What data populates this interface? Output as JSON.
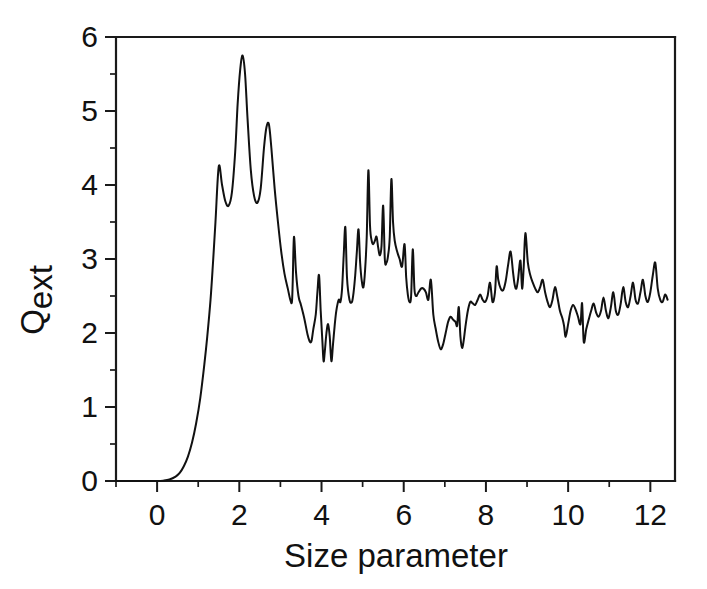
{
  "figure": {
    "background_color": "#ffffff",
    "line_color": "#111111",
    "axis_color": "#1a1a1a"
  },
  "chart_data": {
    "type": "line",
    "title": "",
    "xlabel": "Size parameter",
    "ylabel": "Qext",
    "ylabel_base": "Q",
    "ylabel_subscript": "ext",
    "xlim": [
      -1.0,
      12.6
    ],
    "ylim": [
      0,
      6
    ],
    "xticks": [
      0,
      2,
      4,
      6,
      8,
      10,
      12
    ],
    "xticklabels": [
      "0",
      "2",
      "4",
      "6",
      "8",
      "10",
      "12"
    ],
    "xminorticks": [
      -1,
      1,
      3,
      5,
      7,
      9,
      11
    ],
    "yticks": [
      0,
      1,
      2,
      3,
      4,
      5,
      6
    ],
    "yticklabels": [
      "0",
      "1",
      "2",
      "3",
      "4",
      "5",
      "6"
    ],
    "yminorticks": [
      0.5,
      1.5,
      2.5,
      3.5,
      4.5,
      5.5
    ],
    "grid": false,
    "legend": null,
    "series": [
      {
        "name": "Extinction efficiency",
        "x": [
          -1.0,
          -0.6,
          -0.3,
          0.0,
          0.15,
          0.3,
          0.45,
          0.55,
          0.65,
          0.75,
          0.85,
          0.95,
          1.05,
          1.15,
          1.22,
          1.3,
          1.36,
          1.42,
          1.5,
          1.58,
          1.66,
          1.74,
          1.82,
          1.9,
          1.96,
          2.02,
          2.08,
          2.14,
          2.2,
          2.28,
          2.36,
          2.44,
          2.52,
          2.6,
          2.66,
          2.72,
          2.78,
          2.86,
          2.94,
          3.02,
          3.1,
          3.18,
          3.24,
          3.28,
          3.3,
          3.33,
          3.38,
          3.44,
          3.5,
          3.58,
          3.66,
          3.72,
          3.76,
          3.8,
          3.86,
          3.9,
          3.94,
          3.98,
          4.02,
          4.05,
          4.08,
          4.12,
          4.16,
          4.2,
          4.24,
          4.28,
          4.32,
          4.36,
          4.42,
          4.46,
          4.5,
          4.54,
          4.58,
          4.62,
          4.68,
          4.74,
          4.78,
          4.82,
          4.86,
          4.9,
          4.94,
          4.98,
          5.02,
          5.06,
          5.1,
          5.14,
          5.18,
          5.22,
          5.26,
          5.3,
          5.34,
          5.38,
          5.42,
          5.46,
          5.5,
          5.54,
          5.58,
          5.62,
          5.66,
          5.7,
          5.74,
          5.78,
          5.84,
          5.9,
          5.96,
          6.02,
          6.06,
          6.1,
          6.14,
          6.18,
          6.22,
          6.26,
          6.3,
          6.36,
          6.42,
          6.48,
          6.54,
          6.6,
          6.66,
          6.72,
          6.78,
          6.84,
          6.9,
          6.96,
          7.02,
          7.08,
          7.14,
          7.2,
          7.26,
          7.3,
          7.34,
          7.38,
          7.42,
          7.46,
          7.5,
          7.56,
          7.62,
          7.68,
          7.74,
          7.8,
          7.86,
          7.92,
          7.98,
          8.04,
          8.1,
          8.16,
          8.22,
          8.26,
          8.3,
          8.36,
          8.42,
          8.48,
          8.54,
          8.6,
          8.66,
          8.7,
          8.74,
          8.78,
          8.84,
          8.88,
          8.92,
          8.96,
          9.02,
          9.08,
          9.14,
          9.2,
          9.26,
          9.32,
          9.38,
          9.44,
          9.5,
          9.56,
          9.62,
          9.68,
          9.74,
          9.8,
          9.86,
          9.9,
          9.94,
          10.0,
          10.06,
          10.12,
          10.18,
          10.24,
          10.3,
          10.34,
          10.38,
          10.44,
          10.5,
          10.56,
          10.62,
          10.68,
          10.74,
          10.8,
          10.86,
          10.92,
          10.98,
          11.04,
          11.1,
          11.16,
          11.22,
          11.28,
          11.34,
          11.4,
          11.46,
          11.52,
          11.58,
          11.64,
          11.7,
          11.76,
          11.82,
          11.88,
          11.94,
          12.0,
          12.06,
          12.12,
          12.18,
          12.24,
          12.3,
          12.36,
          12.42
        ],
        "y": [
          0.0,
          0.0,
          0.0,
          0.0,
          0.005,
          0.02,
          0.06,
          0.11,
          0.2,
          0.33,
          0.52,
          0.78,
          1.12,
          1.58,
          1.95,
          2.45,
          2.95,
          3.5,
          4.25,
          4.0,
          3.78,
          3.72,
          3.9,
          4.45,
          5.1,
          5.55,
          5.75,
          5.5,
          4.9,
          4.2,
          3.85,
          3.76,
          3.95,
          4.5,
          4.78,
          4.82,
          4.5,
          3.95,
          3.5,
          3.1,
          2.8,
          2.6,
          2.45,
          2.42,
          2.7,
          3.3,
          2.82,
          2.5,
          2.38,
          2.2,
          1.98,
          1.88,
          1.9,
          2.05,
          2.25,
          2.55,
          2.78,
          2.3,
          1.9,
          1.62,
          1.75,
          2.0,
          2.12,
          1.95,
          1.62,
          1.85,
          2.1,
          2.3,
          2.45,
          2.42,
          2.6,
          3.05,
          3.43,
          2.75,
          2.45,
          2.42,
          2.55,
          2.78,
          3.1,
          3.4,
          2.95,
          2.7,
          2.62,
          2.85,
          3.3,
          4.2,
          3.45,
          3.25,
          3.2,
          3.25,
          3.3,
          3.15,
          3.05,
          3.18,
          3.72,
          3.0,
          2.95,
          3.05,
          3.3,
          4.08,
          3.5,
          3.25,
          3.1,
          3.0,
          2.9,
          3.2,
          2.75,
          2.52,
          2.42,
          2.5,
          3.13,
          2.6,
          2.5,
          2.55,
          2.6,
          2.6,
          2.55,
          2.45,
          2.72,
          2.25,
          2.05,
          1.88,
          1.78,
          1.85,
          2.0,
          2.15,
          2.22,
          2.18,
          2.15,
          2.1,
          2.35,
          1.95,
          1.8,
          1.9,
          2.08,
          2.3,
          2.42,
          2.4,
          2.38,
          2.45,
          2.52,
          2.45,
          2.42,
          2.5,
          2.68,
          2.42,
          2.55,
          2.9,
          2.72,
          2.6,
          2.58,
          2.7,
          2.92,
          3.1,
          2.82,
          2.65,
          2.6,
          2.72,
          2.98,
          2.6,
          2.9,
          3.35,
          2.95,
          2.78,
          2.68,
          2.6,
          2.55,
          2.62,
          2.72,
          2.55,
          2.42,
          2.35,
          2.45,
          2.62,
          2.48,
          2.3,
          2.2,
          2.1,
          1.95,
          2.12,
          2.3,
          2.38,
          2.32,
          2.22,
          2.12,
          2.4,
          1.88,
          2.05,
          2.18,
          2.3,
          2.4,
          2.28,
          2.22,
          2.3,
          2.48,
          2.3,
          2.2,
          2.35,
          2.55,
          2.3,
          2.25,
          2.4,
          2.62,
          2.42,
          2.35,
          2.5,
          2.68,
          2.45,
          2.4,
          2.55,
          2.72,
          2.5,
          2.42,
          2.55,
          2.78,
          2.95,
          2.6,
          2.45,
          2.42,
          2.52,
          2.45
        ]
      }
    ]
  }
}
